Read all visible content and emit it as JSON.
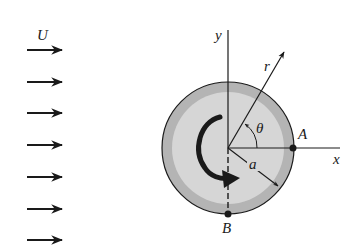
{
  "diagram": {
    "labels": {
      "freestream": "U",
      "y_axis": "y",
      "x_axis": "x",
      "radius_vector": "r",
      "angle": "θ",
      "cylinder_radius": "a",
      "point_a": "A",
      "point_b": "B"
    },
    "colors": {
      "outer_ring": "#b4b4b4",
      "inner_disk": "#d6d6d6",
      "stroke": "#1a1a1a",
      "background": "#ffffff"
    },
    "freestream_arrow_count": 7
  }
}
